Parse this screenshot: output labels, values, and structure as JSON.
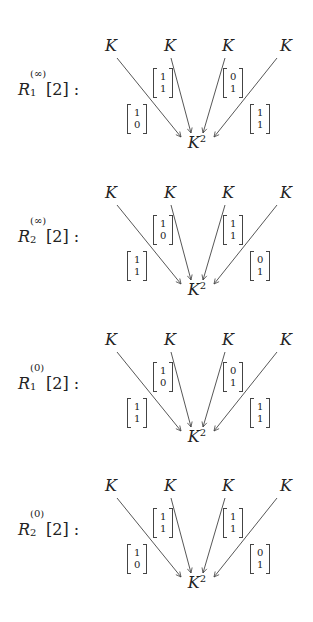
{
  "diagrams": [
    {
      "label": {
        "base": "R",
        "sub": "1",
        "sup": "(∞)",
        "arg": "[2] :"
      },
      "sources": [
        "K",
        "K",
        "K",
        "K"
      ],
      "target": {
        "base": "K",
        "sup": "2"
      },
      "vectors": [
        [
          "1",
          "0"
        ],
        [
          "1",
          "1"
        ],
        [
          "0",
          "1"
        ],
        [
          "1",
          "1"
        ]
      ]
    },
    {
      "label": {
        "base": "R",
        "sub": "2",
        "sup": "(∞)",
        "arg": "[2] :"
      },
      "sources": [
        "K",
        "K",
        "K",
        "K"
      ],
      "target": {
        "base": "K",
        "sup": "2"
      },
      "vectors": [
        [
          "1",
          "1"
        ],
        [
          "1",
          "0"
        ],
        [
          "1",
          "1"
        ],
        [
          "0",
          "1"
        ]
      ]
    },
    {
      "label": {
        "base": "R",
        "sub": "1",
        "sup": "(0)",
        "arg": "[2] :"
      },
      "sources": [
        "K",
        "K",
        "K",
        "K"
      ],
      "target": {
        "base": "K",
        "sup": "2"
      },
      "vectors": [
        [
          "1",
          "1"
        ],
        [
          "1",
          "0"
        ],
        [
          "0",
          "1"
        ],
        [
          "1",
          "1"
        ]
      ]
    },
    {
      "label": {
        "base": "R",
        "sub": "2",
        "sup": "(0)",
        "arg": "[2] :"
      },
      "sources": [
        "K",
        "K",
        "K",
        "K"
      ],
      "target": {
        "base": "K",
        "sup": "2"
      },
      "vectors": [
        [
          "1",
          "0"
        ],
        [
          "1",
          "1"
        ],
        [
          "1",
          "1"
        ],
        [
          "0",
          "1"
        ]
      ]
    }
  ],
  "colors": {
    "line": "#444444",
    "text": "#222222",
    "background": "#ffffff"
  }
}
